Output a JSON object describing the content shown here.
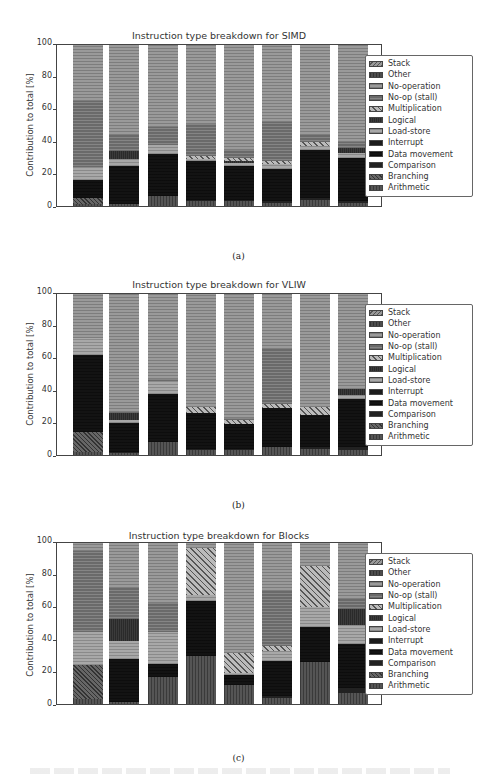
{
  "categories": [
    "Binarization",
    "Erosion",
    "Projection",
    "FIR",
    "IIR",
    "FFT",
    "2D Convolution",
    "FFoS"
  ],
  "series_order": [
    "Arithmetic",
    "Branching",
    "Comparison",
    "Data movement",
    "Interrupt",
    "Load-store",
    "Logical",
    "Multiplication",
    "No-op (stall)",
    "No-operation",
    "Other",
    "Stack"
  ],
  "legend": [
    {
      "label": "Stack",
      "key": "stack"
    },
    {
      "label": "Other",
      "key": "other"
    },
    {
      "label": "No-operation",
      "key": "noop"
    },
    {
      "label": "No-op (stall)",
      "key": "stall"
    },
    {
      "label": "Multiplication",
      "key": "mult"
    },
    {
      "label": "Logical",
      "key": "logical"
    },
    {
      "label": "Load-store",
      "key": "loadstore"
    },
    {
      "label": "Interrupt",
      "key": "interrupt"
    },
    {
      "label": "Data movement",
      "key": "datamov"
    },
    {
      "label": "Comparison",
      "key": "comp"
    },
    {
      "label": "Branching",
      "key": "branch"
    },
    {
      "label": "Arithmetic",
      "key": "arith"
    }
  ],
  "axis": {
    "ylabel": "Contribution to total [%]",
    "yticks": [
      "0",
      "20",
      "40",
      "60",
      "80",
      "100"
    ]
  },
  "captions": {
    "a": "(a)",
    "b": "(b)",
    "c": "(c)"
  },
  "chart_data": [
    {
      "type": "bar",
      "stacked": true,
      "title": "Instruction type breakdown for SIMD",
      "xlabel": "",
      "ylabel": "Contribution to total [%]",
      "ylim": [
        0,
        100
      ],
      "legend_position": "right",
      "categories": [
        "Binarization",
        "Erosion",
        "Projection",
        "FIR",
        "IIR",
        "FFT",
        "2D Convolution",
        "FFoS"
      ],
      "series": [
        {
          "name": "Arithmetic",
          "values": [
            1,
            1,
            6,
            3,
            3,
            2,
            4,
            2
          ]
        },
        {
          "name": "Branching",
          "values": [
            4,
            0,
            0,
            0,
            0,
            0,
            0,
            0
          ]
        },
        {
          "name": "Comparison",
          "values": [
            0,
            0,
            0,
            1,
            1,
            1,
            1,
            1
          ]
        },
        {
          "name": "Data movement",
          "values": [
            11,
            24,
            26,
            24,
            21,
            20,
            30,
            27
          ]
        },
        {
          "name": "Interrupt",
          "values": [
            0,
            0,
            0,
            0,
            0,
            0,
            0,
            0
          ]
        },
        {
          "name": "Load-store",
          "values": [
            8,
            4,
            6,
            1,
            2,
            3,
            2,
            3
          ]
        },
        {
          "name": "Logical",
          "values": [
            0,
            5,
            0,
            0,
            1,
            0,
            0,
            3
          ]
        },
        {
          "name": "Multiplication",
          "values": [
            0,
            0,
            0,
            2,
            2,
            2,
            3,
            0
          ]
        },
        {
          "name": "No-op (stall)",
          "values": [
            41,
            10,
            11,
            20,
            5,
            24,
            4,
            4
          ]
        },
        {
          "name": "No-operation",
          "values": [
            35,
            56,
            51,
            49,
            65,
            48,
            56,
            60
          ]
        },
        {
          "name": "Other",
          "values": [
            0,
            0,
            0,
            0,
            0,
            0,
            0,
            0
          ]
        },
        {
          "name": "Stack",
          "values": [
            0,
            0,
            0,
            0,
            0,
            0,
            0,
            0
          ]
        }
      ]
    },
    {
      "type": "bar",
      "stacked": true,
      "title": "Instruction type breakdown for VLIW",
      "xlabel": "",
      "ylabel": "Contribution to total [%]",
      "ylim": [
        0,
        100
      ],
      "legend_position": "right",
      "categories": [
        "Binarization",
        "Erosion",
        "Projection",
        "FIR",
        "IIR",
        "FFT",
        "2D Convolution",
        "FFoS"
      ],
      "series": [
        {
          "name": "Arithmetic",
          "values": [
            2,
            1,
            8,
            3,
            3,
            5,
            4,
            3
          ]
        },
        {
          "name": "Branching",
          "values": [
            12,
            0,
            0,
            0,
            0,
            0,
            0,
            0
          ]
        },
        {
          "name": "Comparison",
          "values": [
            0,
            1,
            0,
            1,
            1,
            0,
            1,
            2
          ]
        },
        {
          "name": "Data movement",
          "values": [
            48,
            18,
            30,
            22,
            15,
            24,
            20,
            30
          ]
        },
        {
          "name": "Interrupt",
          "values": [
            0,
            0,
            0,
            0,
            0,
            0,
            0,
            0
          ]
        },
        {
          "name": "Load-store",
          "values": [
            11,
            2,
            8,
            0,
            0,
            0,
            0,
            2
          ]
        },
        {
          "name": "Logical",
          "values": [
            0,
            4,
            0,
            0,
            0,
            0,
            0,
            4
          ]
        },
        {
          "name": "Multiplication",
          "values": [
            0,
            0,
            0,
            4,
            3,
            3,
            5,
            0
          ]
        },
        {
          "name": "No-op (stall)",
          "values": [
            0,
            1,
            1,
            0,
            1,
            34,
            0,
            0
          ]
        },
        {
          "name": "No-operation",
          "values": [
            27,
            73,
            53,
            70,
            77,
            34,
            70,
            59
          ]
        },
        {
          "name": "Other",
          "values": [
            0,
            0,
            0,
            0,
            0,
            0,
            0,
            0
          ]
        },
        {
          "name": "Stack",
          "values": [
            0,
            0,
            0,
            0,
            0,
            0,
            0,
            0
          ]
        }
      ]
    },
    {
      "type": "bar",
      "stacked": true,
      "title": "Instruction type breakdown for Blocks",
      "xlabel": "",
      "ylabel": "Contribution to total [%]",
      "ylim": [
        0,
        100
      ],
      "legend_position": "right",
      "categories": [
        "Binarization",
        "Erosion",
        "Projection",
        "FIR",
        "IIR",
        "FFT",
        "2D Convolution",
        "FFoS"
      ],
      "series": [
        {
          "name": "Arithmetic",
          "values": [
            3,
            1,
            17,
            30,
            12,
            4,
            26,
            7
          ]
        },
        {
          "name": "Branching",
          "values": [
            21,
            0,
            0,
            0,
            0,
            0,
            0,
            0
          ]
        },
        {
          "name": "Comparison",
          "values": [
            0,
            0,
            0,
            0,
            0,
            1,
            0,
            3
          ]
        },
        {
          "name": "Data movement",
          "values": [
            0,
            27,
            8,
            34,
            6,
            22,
            22,
            27
          ]
        },
        {
          "name": "Interrupt",
          "values": [
            0,
            0,
            0,
            0,
            0,
            0,
            0,
            0
          ]
        },
        {
          "name": "Load-store",
          "values": [
            21,
            11,
            20,
            4,
            1,
            6,
            12,
            12
          ]
        },
        {
          "name": "Logical",
          "values": [
            0,
            14,
            0,
            0,
            0,
            0,
            0,
            10
          ]
        },
        {
          "name": "Multiplication",
          "values": [
            0,
            0,
            0,
            29,
            13,
            3,
            26,
            0
          ]
        },
        {
          "name": "No-op (stall)",
          "values": [
            50,
            19,
            18,
            0,
            0,
            34,
            0,
            6
          ]
        },
        {
          "name": "No-operation",
          "values": [
            5,
            28,
            37,
            3,
            68,
            30,
            14,
            35
          ]
        },
        {
          "name": "Other",
          "values": [
            0,
            0,
            0,
            0,
            0,
            0,
            0,
            0
          ]
        },
        {
          "name": "Stack",
          "values": [
            0,
            0,
            0,
            0,
            0,
            0,
            0,
            0
          ]
        }
      ]
    }
  ]
}
